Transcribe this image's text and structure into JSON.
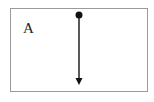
{
  "diagram": {
    "box_label": "A",
    "colors": {
      "border": "#9a9a9a",
      "vector": "#222222",
      "background": "#ffffff"
    },
    "vector": {
      "origin_icon": "dot-icon",
      "direction": "down",
      "head_icon": "arrowhead-down-icon"
    }
  }
}
